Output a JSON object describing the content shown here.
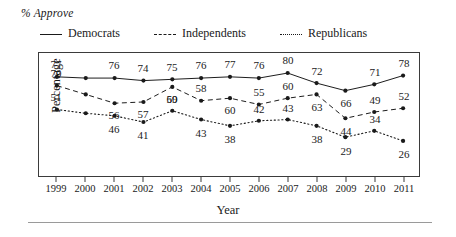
{
  "chart_data": {
    "type": "line",
    "title": "% Approve",
    "xlabel": "Year",
    "ylabel": "Percentage",
    "grid": false,
    "legend_position": "top",
    "ylim": [
      20,
      85
    ],
    "categories": [
      "1999",
      "2000",
      "2001",
      "2002",
      "2003",
      "2004",
      "2005",
      "2006",
      "2007",
      "2008",
      "2009",
      "2010",
      "2011"
    ],
    "series": [
      {
        "name": "Democrats",
        "style": "solid",
        "values": [
          77,
          76,
          76,
          74,
          75,
          76,
          77,
          76,
          80,
          72,
          66,
          71,
          78
        ],
        "labels": [
          "77",
          "",
          "76",
          "74",
          "75",
          "76",
          "77",
          "76",
          "80",
          "72",
          "66",
          "71",
          "78"
        ]
      },
      {
        "name": "Independents",
        "style": "dashed",
        "values": [
          70,
          63,
          56,
          57,
          69,
          58,
          60,
          55,
          60,
          63,
          44,
          49,
          52
        ],
        "labels": [
          "70",
          "",
          "56",
          "57",
          "69",
          "58",
          "60",
          "55",
          "60",
          "63",
          "44",
          "49",
          "52"
        ]
      },
      {
        "name": "Republicans",
        "style": "dotted",
        "values": [
          51,
          48,
          46,
          41,
          50,
          43,
          38,
          42,
          43,
          38,
          29,
          34,
          26
        ],
        "labels": [
          "51",
          "",
          "46",
          "41",
          "50",
          "43",
          "38",
          "42",
          "43",
          "38",
          "29",
          "34",
          "26"
        ]
      }
    ]
  },
  "legend": {
    "items": [
      {
        "label": "Democrats",
        "style": "solid"
      },
      {
        "label": "Independents",
        "style": "dashed"
      },
      {
        "label": "Republicans",
        "style": "dotted"
      }
    ]
  },
  "axes": {
    "x_title": "Year",
    "y_title": "Percentage"
  },
  "colors": {
    "line": "#1a1a1a",
    "frame": "#3b3b3b",
    "rule": "#9a9a9a",
    "background": "#ffffff"
  }
}
